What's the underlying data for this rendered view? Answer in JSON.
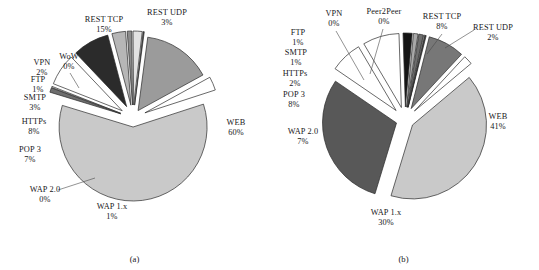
{
  "figure": {
    "background": "#ffffff",
    "text_color": "#17171a"
  },
  "panels": [
    {
      "id": "a",
      "caption": "(a)",
      "center": {
        "x": 133,
        "y": 118
      },
      "radius": 74,
      "start_angle": -18,
      "chart_data": {
        "type": "pie",
        "title": "",
        "labels": [
          "WEB",
          "WAP 1.x",
          "WAP 2.0",
          "POP 3",
          "HTTPs",
          "SMTP",
          "FTP",
          "VPN",
          "WoW",
          "REST TCP",
          "REST UDP"
        ],
        "values": [
          60,
          1,
          0,
          7,
          8,
          3,
          1,
          2,
          0,
          15,
          3
        ],
        "value_suffix": "%",
        "colors": [
          "#c9c9c9",
          "#6e6e6e",
          "#ffffff",
          "#ffffff",
          "#2b2b2b",
          "#b6b6b6",
          "#8c8c8c",
          "#e2e2e2",
          "#4d4d4d",
          "#9b9b9b",
          "#ffffff"
        ],
        "exploded": true,
        "legend": "none",
        "grid": false
      },
      "labels": [
        {
          "name": "web",
          "text": "WEB",
          "pct": "60%",
          "x": 236,
          "y": 128
        },
        {
          "name": "wap1x",
          "text": "WAP 1.x",
          "pct": "1%",
          "x": 112,
          "y": 212
        },
        {
          "name": "wap20",
          "text": "WAP 2.0",
          "pct": "0%",
          "x": 45,
          "y": 195
        },
        {
          "name": "pop3",
          "text": "POP 3",
          "pct": "7%",
          "x": 30,
          "y": 155
        },
        {
          "name": "https",
          "text": "HTTPs",
          "pct": "8%",
          "x": 34,
          "y": 127
        },
        {
          "name": "smtp",
          "text": "SMTP",
          "pct": "3%",
          "x": 35,
          "y": 103
        },
        {
          "name": "ftp",
          "text": "FTP",
          "pct": "1%",
          "x": 38,
          "y": 85
        },
        {
          "name": "vpn",
          "text": "VPN",
          "pct": "2%",
          "x": 42,
          "y": 68
        },
        {
          "name": "wow",
          "text": "WoW",
          "pct": "0%",
          "x": 69,
          "y": 62
        },
        {
          "name": "rest-tcp",
          "text": "REST TCP",
          "pct": "15%",
          "x": 104,
          "y": 25
        },
        {
          "name": "rest-udp",
          "text": "REST UDP",
          "pct": "3%",
          "x": 167,
          "y": 18
        }
      ],
      "leaders": [
        {
          "name": "wow-leader",
          "x1": 70,
          "y1": 73,
          "x2": 79,
          "y2": 88
        },
        {
          "name": "wap20-leader",
          "x1": 58,
          "y1": 190,
          "x2": 95,
          "y2": 178
        }
      ]
    },
    {
      "id": "b",
      "caption": "(b)",
      "center": {
        "x": 136,
        "y": 120
      },
      "radius": 74,
      "start_angle": -40,
      "chart_data": {
        "type": "pie",
        "title": "",
        "labels": [
          "WEB",
          "WAP 1.x",
          "WAP 2.0",
          "POP 3",
          "HTTPs",
          "SMTP",
          "FTP",
          "VPN",
          "Peer2Peer",
          "REST TCP",
          "REST UDP"
        ],
        "values": [
          41,
          30,
          7,
          8,
          2,
          1,
          1,
          0,
          0,
          8,
          2
        ],
        "value_suffix": "%",
        "colors": [
          "#c9c9c9",
          "#585858",
          "#ffffff",
          "#ffffff",
          "#141414",
          "#a8a8a8",
          "#6e6e6e",
          "#d8d8d8",
          "#3d3d3d",
          "#777777",
          "#ffffff"
        ],
        "exploded": true,
        "legend": "none",
        "grid": false
      },
      "labels": [
        {
          "name": "web",
          "text": "WEB",
          "pct": "41%",
          "x": 229,
          "y": 122
        },
        {
          "name": "wap1x",
          "text": "WAP 1.x",
          "pct": "30%",
          "x": 117,
          "y": 218
        },
        {
          "name": "wap20",
          "text": "WAP 2.0",
          "pct": "7%",
          "x": 34,
          "y": 137
        },
        {
          "name": "pop3",
          "text": "POP 3",
          "pct": "8%",
          "x": 25,
          "y": 100
        },
        {
          "name": "https",
          "text": "HTTPs",
          "pct": "2%",
          "x": 26,
          "y": 79
        },
        {
          "name": "smtp",
          "text": "SMTP",
          "pct": "1%",
          "x": 27,
          "y": 58
        },
        {
          "name": "ftp",
          "text": "FTP",
          "pct": "1%",
          "x": 29,
          "y": 38
        },
        {
          "name": "vpn",
          "text": "VPN",
          "pct": "0%",
          "x": 65,
          "y": 19
        },
        {
          "name": "peer2peer",
          "text": "Peer2Peer",
          "pct": "0%",
          "x": 115,
          "y": 17
        },
        {
          "name": "rest-tcp",
          "text": "REST TCP",
          "pct": "8%",
          "x": 173,
          "y": 22
        },
        {
          "name": "rest-udp",
          "text": "REST UDP",
          "pct": "2%",
          "x": 224,
          "y": 33
        }
      ],
      "leaders": [
        {
          "name": "vpn-leader",
          "x1": 67,
          "y1": 31,
          "x2": 95,
          "y2": 80
        },
        {
          "name": "peer2peer-leader",
          "x1": 114,
          "y1": 29,
          "x2": 101,
          "y2": 74
        },
        {
          "name": "rest-tcp-leader",
          "x1": 173,
          "y1": 34,
          "x2": 158,
          "y2": 54
        },
        {
          "name": "rest-udp-leader",
          "x1": 205,
          "y1": 30,
          "x2": 176,
          "y2": 48
        }
      ]
    }
  ]
}
